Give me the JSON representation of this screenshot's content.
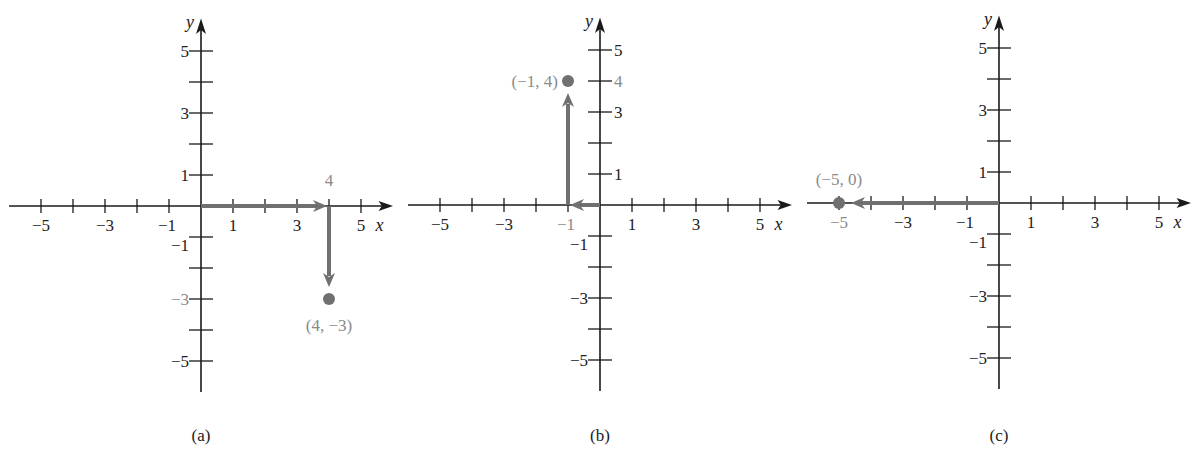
{
  "figure": {
    "panels": [
      {
        "id": "a",
        "caption": "(a)",
        "origin_px": [
          201,
          206
        ],
        "unit_px": [
          32,
          31
        ],
        "x_axis_label": "x",
        "y_axis_label": "y",
        "x_tick_labels": [
          "−5",
          "−3",
          "−1",
          "1",
          "3",
          "5"
        ],
        "y_tick_labels": [
          "5",
          "3",
          "1",
          "−1",
          "−3",
          "−5"
        ],
        "point": {
          "x": 4,
          "y": -3,
          "label": "(4, −3)"
        },
        "extra_label": "4",
        "path": [
          [
            0,
            0
          ],
          [
            4,
            0
          ],
          [
            4,
            -3
          ]
        ]
      },
      {
        "id": "b",
        "caption": "(b)",
        "origin_px": [
          600,
          205
        ],
        "unit_px": [
          32,
          31
        ],
        "x_axis_label": "x",
        "y_axis_label": "y",
        "x_tick_labels": [
          "−5",
          "−3",
          "−1",
          "1",
          "3",
          "5"
        ],
        "y_tick_labels": [
          "5",
          "4",
          "3",
          "1",
          "−1",
          "−3",
          "−5"
        ],
        "point": {
          "x": -1,
          "y": 4,
          "label": "(−1, 4)"
        },
        "path": [
          [
            0,
            0
          ],
          [
            -1,
            0
          ],
          [
            -1,
            4
          ]
        ]
      },
      {
        "id": "c",
        "caption": "(c)",
        "origin_px": [
          999,
          203
        ],
        "unit_px": [
          32,
          31
        ],
        "x_axis_label": "x",
        "y_axis_label": "y",
        "x_tick_labels": [
          "−5",
          "−3",
          "−1",
          "1",
          "3",
          "5"
        ],
        "y_tick_labels": [
          "5",
          "3",
          "1",
          "−1",
          "−3",
          "−5"
        ],
        "point": {
          "x": -5,
          "y": 0,
          "label": "(−5, 0)"
        },
        "path": [
          [
            0,
            0
          ],
          [
            -5,
            0
          ]
        ]
      }
    ],
    "colors": {
      "axis": "#1a1a1a",
      "vector": "#707070",
      "highlight_text": "#8a8a8a"
    }
  },
  "chart_data": [
    {
      "type": "scatter",
      "title": "(a)",
      "xlabel": "x",
      "ylabel": "y",
      "xlim": [
        -5,
        5
      ],
      "ylim": [
        -5,
        5
      ],
      "points": [
        {
          "x": 4,
          "y": -3,
          "label": "(4, −3)"
        }
      ],
      "path": [
        [
          0,
          0
        ],
        [
          4,
          0
        ],
        [
          4,
          -3
        ]
      ]
    },
    {
      "type": "scatter",
      "title": "(b)",
      "xlabel": "x",
      "ylabel": "y",
      "xlim": [
        -5,
        5
      ],
      "ylim": [
        -5,
        5
      ],
      "points": [
        {
          "x": -1,
          "y": 4,
          "label": "(−1, 4)"
        }
      ],
      "path": [
        [
          0,
          0
        ],
        [
          -1,
          0
        ],
        [
          -1,
          4
        ]
      ]
    },
    {
      "type": "scatter",
      "title": "(c)",
      "xlabel": "x",
      "ylabel": "y",
      "xlim": [
        -5,
        5
      ],
      "ylim": [
        -5,
        5
      ],
      "points": [
        {
          "x": -5,
          "y": 0,
          "label": "(−5, 0)"
        }
      ],
      "path": [
        [
          0,
          0
        ],
        [
          -5,
          0
        ]
      ]
    }
  ]
}
